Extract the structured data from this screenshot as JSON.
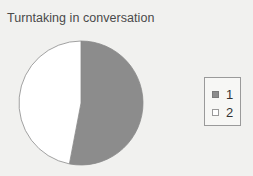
{
  "chart_data": {
    "type": "pie",
    "title": "Turntaking in conversation",
    "categories": [
      "1",
      "2"
    ],
    "values": [
      53,
      47
    ],
    "colors": [
      "#8c8c8c",
      "#ffffff"
    ],
    "start_angle_deg": 0,
    "direction": "clockwise",
    "legend": {
      "position": "right",
      "entries": [
        {
          "label": "1",
          "color": "#8c8c8c"
        },
        {
          "label": "2",
          "color": "#ffffff"
        }
      ]
    }
  },
  "colors": {
    "background": "#f1f1ef",
    "slice_1": "#8c8c8c",
    "slice_2": "#ffffff",
    "outline": "#8a8a8a"
  }
}
